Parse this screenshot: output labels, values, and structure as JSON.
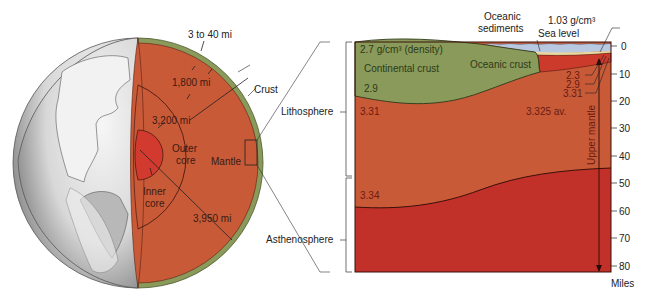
{
  "globe": {
    "labels": {
      "crust_thickness": "3 to 40 mi",
      "mantle_depth": "1,800 mi",
      "outer_core_depth": "3,200 mi",
      "radius": "3,950 mi",
      "crust": "Crust",
      "outer_core_line1": "Outer",
      "outer_core_line2": "core",
      "mantle": "Mantle",
      "inner_core_line1": "Inner",
      "inner_core_line2": "core"
    }
  },
  "section": {
    "left_labels": {
      "lithosphere": "Lithosphere",
      "asthenosphere": "Asthenosphere"
    },
    "top_labels": {
      "oceanic_sediments_line1": "Oceanic",
      "oceanic_sediments_line2": "sediments",
      "seawater_density": "1.03 g/cm³",
      "sea_level": "Sea level"
    },
    "layer_labels": {
      "continental_density": "2.7 g/cm³ (density)",
      "continental_crust": "Continental crust",
      "continental_lower": "2.9",
      "oceanic_crust": "Oceanic crust",
      "mantle_left": "3.31",
      "asthenosphere_top": "3.34",
      "oceanic_d1": "2.3",
      "oceanic_d2": "2.9",
      "oceanic_d3": "3.31",
      "mantle_avg": "3.325 av.",
      "upper_mantle": "Upper mantle"
    },
    "axis": {
      "ticks": [
        "0",
        "10",
        "20",
        "30",
        "40",
        "50",
        "60",
        "70",
        "80"
      ],
      "unit": "Miles"
    },
    "colors": {
      "crust_green": "#8a9a5b",
      "mantle_orange": "#c85a38",
      "asthenosphere_red": "#c2302a",
      "seawater_blue": "#b8c8e0",
      "inner_core_red": "#d23a30"
    }
  }
}
